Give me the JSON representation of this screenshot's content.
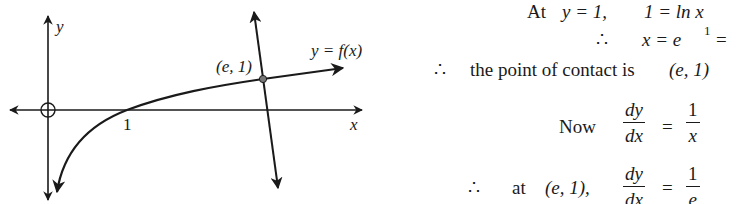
{
  "graph": {
    "axis_labels": {
      "x": "x",
      "y": "y"
    },
    "x_intercept_label": "1",
    "point_label": "(e, 1)",
    "curve_label": "y = f(x)",
    "origin_marker": "open-circle",
    "elements": [
      "x-axis",
      "y-axis",
      "ln-curve",
      "normal-line",
      "contact-point"
    ]
  },
  "working": {
    "line1": {
      "prefix": "At",
      "condition": "y = 1,",
      "equation": "1 = ln x"
    },
    "line2": {
      "symbol": "∴",
      "equation": "x = e",
      "superscript": "1",
      "tail": "="
    },
    "line3": {
      "symbol": "∴",
      "text": "the point of contact is",
      "point": "(e, 1)"
    },
    "line4": {
      "prefix": "Now",
      "lhs_num": "dy",
      "lhs_den": "dx",
      "eq": "=",
      "rhs_num": "1",
      "rhs_den": "x"
    },
    "line5": {
      "symbol": "∴",
      "prefix": "at",
      "point": "(e, 1),",
      "lhs_num": "dy",
      "lhs_den": "dx",
      "eq": "=",
      "rhs_num": "1",
      "rhs_den": "e"
    }
  }
}
